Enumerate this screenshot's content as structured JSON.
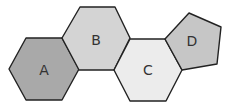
{
  "diagram": {
    "title": "",
    "shapes": [
      {
        "id": "A",
        "label": "A",
        "kind": "hexagon",
        "fill": "#a9a9a9",
        "points": "9,69 26,38 62,38 79,69 62,100 26,100",
        "label_pos": [
          44,
          70
        ]
      },
      {
        "id": "B",
        "label": "B",
        "kind": "hexagon",
        "fill": "#d4d4d4",
        "points": "62,38 80,7 115,7 130,38 114,70 79,70",
        "label_pos": [
          96,
          40
        ]
      },
      {
        "id": "C",
        "label": "C",
        "kind": "hexagon",
        "fill": "#ececec",
        "points": "114,70 130,39 165,39 182,70 166,101 130,101",
        "label_pos": [
          148,
          70
        ]
      },
      {
        "id": "D",
        "label": "D",
        "kind": "pentagon",
        "fill": "#c6c6c6",
        "points": "165,39 189,13 221,27 217,64 182,70",
        "label_pos": [
          192,
          41
        ]
      }
    ]
  }
}
